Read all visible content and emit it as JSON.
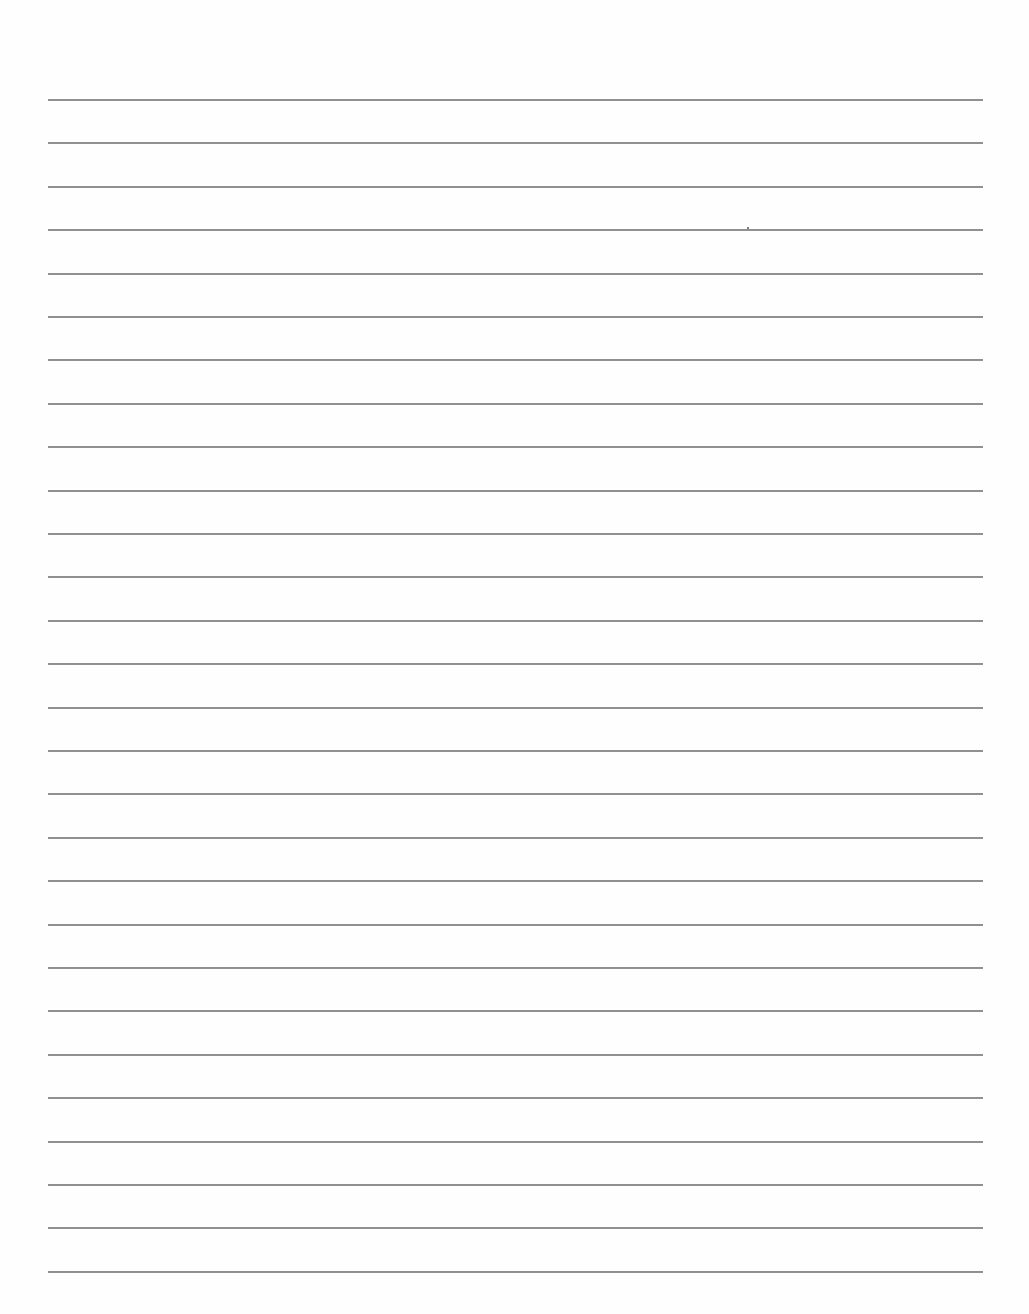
{
  "document": {
    "type": "ruled-sheet",
    "line_count": 28,
    "first_line_y": 99,
    "line_spacing": 43.4,
    "line_left": 48,
    "line_width": 935,
    "line_color": "#8f8f8f",
    "background": "#fefefe",
    "content": ""
  },
  "marks": [
    {
      "x": 747,
      "y": 227
    }
  ]
}
